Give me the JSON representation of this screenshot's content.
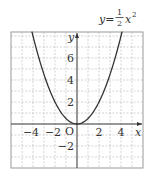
{
  "chart_data": {
    "type": "line",
    "title": "",
    "equation": {
      "lhs": "y=",
      "numerator": "1",
      "denominator": "2",
      "var": "x",
      "exp": "2"
    },
    "xlabel": "x",
    "ylabel": "y",
    "origin_label": "O",
    "xlim": [
      -6,
      6
    ],
    "ylim": [
      -4,
      8.4
    ],
    "grid": true,
    "grid_step": 1,
    "x_ticks": [
      {
        "value": -4,
        "label": "−4"
      },
      {
        "value": -2,
        "label": "−2"
      },
      {
        "value": 2,
        "label": "2"
      },
      {
        "value": 4,
        "label": "4"
      }
    ],
    "y_ticks": [
      {
        "value": 6,
        "label": "6"
      },
      {
        "value": 4,
        "label": "4"
      },
      {
        "value": 2,
        "label": "2"
      },
      {
        "value": -2,
        "label": "−2"
      }
    ],
    "series": [
      {
        "name": "y = 1/2 x^2",
        "function": "0.5*x^2",
        "x": [
          -4.1,
          -4,
          -3,
          -2,
          -1,
          0,
          1,
          2,
          3,
          4,
          4.1
        ],
        "y": [
          8.4,
          8,
          4.5,
          2,
          0.5,
          0,
          0.5,
          2,
          4.5,
          8,
          8.4
        ]
      }
    ],
    "colors": {
      "curve": "#333333",
      "axes": "#333333",
      "grid": "#b5b5b5",
      "frame": "#9a9a9a"
    }
  }
}
